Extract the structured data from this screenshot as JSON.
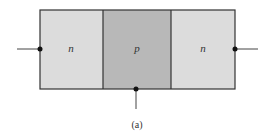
{
  "diagram": {
    "regions": [
      {
        "label": "n",
        "color": "#dcdcdc"
      },
      {
        "label": "p",
        "color": "#b8b8b8"
      },
      {
        "label": "n",
        "color": "#dcdcdc"
      }
    ],
    "terminals": [
      "left",
      "bottom",
      "right"
    ],
    "caption": "(a)",
    "border_color": "#333333"
  }
}
